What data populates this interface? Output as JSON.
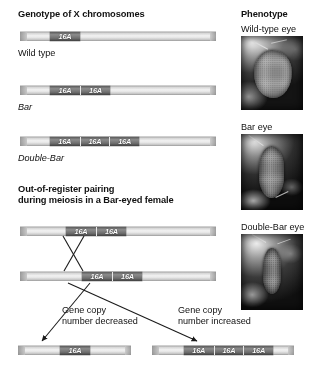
{
  "columns": {
    "genotype_header": "Genotype of X chromosomes",
    "phenotype_header": "Phenotype"
  },
  "genotypes": [
    {
      "name": "wild-type",
      "label": "Wild type",
      "bands": [
        "16A"
      ],
      "copies": 1
    },
    {
      "name": "bar",
      "label": "Bar",
      "bands": [
        "16A",
        "16A"
      ],
      "copies": 2
    },
    {
      "name": "double-bar",
      "label": "Double-Bar",
      "bands": [
        "16A",
        "16A",
        "16A"
      ],
      "copies": 3
    }
  ],
  "phenotypes": [
    {
      "name": "wild-type-eye",
      "caption": "Wild-type eye"
    },
    {
      "name": "bar-eye",
      "caption": "Bar eye"
    },
    {
      "name": "double-bar-eye",
      "caption": "Double-Bar eye"
    }
  ],
  "meiosis": {
    "heading_line1": "Out-of-register pairing",
    "heading_line2": "during meiosis in a Bar-eyed female",
    "upper_chromosome_bands": [
      "16A",
      "16A"
    ],
    "lower_chromosome_bands": [
      "16A",
      "16A"
    ],
    "crossover_symbol": "X"
  },
  "outcomes": [
    {
      "name": "decreased",
      "caption_line1": "Gene copy",
      "caption_line2": "number decreased",
      "bands": [
        "16A"
      ],
      "copies": 1
    },
    {
      "name": "increased",
      "caption_line1": "Gene copy",
      "caption_line2": "number increased",
      "bands": [
        "16A",
        "16A",
        "16A"
      ],
      "copies": 3
    }
  ],
  "band_label": "16A",
  "colors": {
    "background": "#ffffff",
    "text": "#111111",
    "chromosome_light": "#e6e6e6",
    "band_dark": "#5a5a5a",
    "line": "#1a1a1a"
  }
}
